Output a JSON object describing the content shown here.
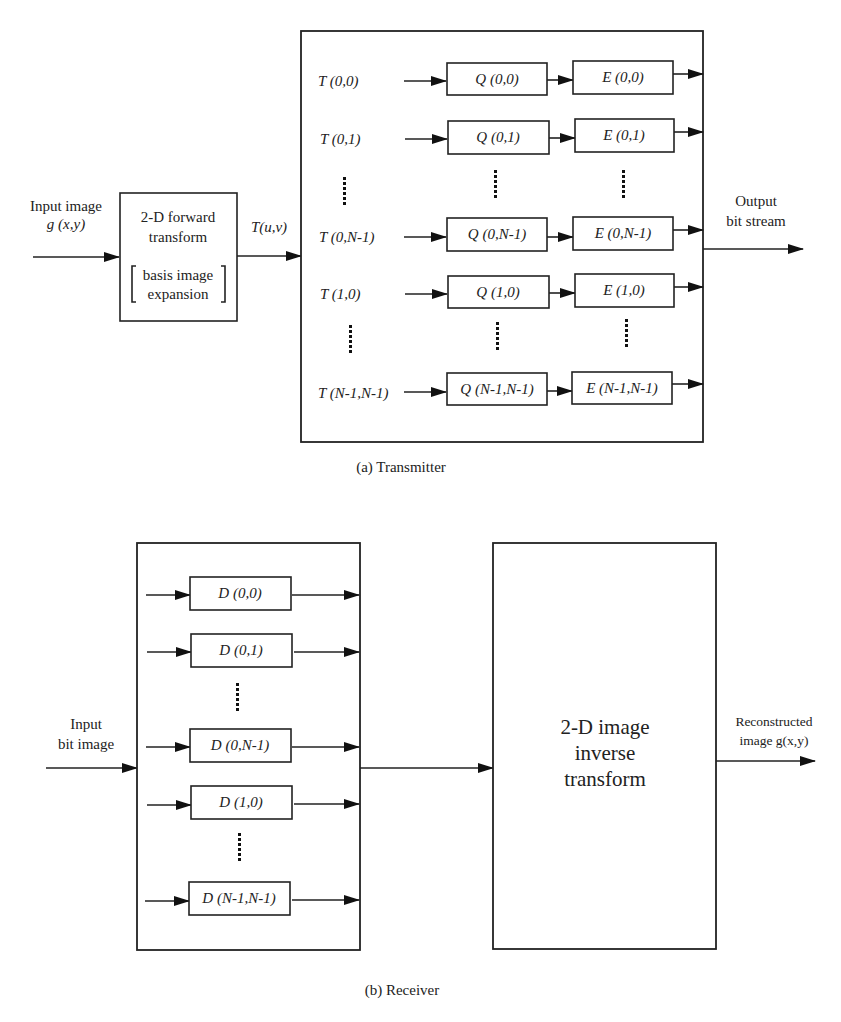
{
  "transmitter": {
    "caption": "(a) Transmitter",
    "input_label_line1": "Input image",
    "input_label_line2": "g (x,y)",
    "forward_block": {
      "line1": "2-D forward",
      "line2": "transform",
      "line3": "basis image",
      "line4": "expansion"
    },
    "transform_output_label": "T(u,v)",
    "rows": [
      {
        "t": "T (0,0)",
        "q": "Q (0,0)",
        "e": "E (0,0)"
      },
      {
        "t": "T (0,1)",
        "q": "Q (0,1)",
        "e": "E (0,1)"
      },
      {
        "t": "T (0,N-1)",
        "q": "Q (0,N-1)",
        "e": "E (0,N-1)"
      },
      {
        "t": "T (1,0)",
        "q": "Q (1,0)",
        "e": "E (1,0)"
      },
      {
        "t": "T (N-1,N-1)",
        "q": "Q (N-1,N-1)",
        "e": "E (N-1,N-1)"
      }
    ],
    "output_label_line1": "Output",
    "output_label_line2": "bit stream"
  },
  "receiver": {
    "caption": "(b) Receiver",
    "input_label_line1": "Input",
    "input_label_line2": "bit image",
    "rows": [
      {
        "d": "D (0,0)"
      },
      {
        "d": "D (0,1)"
      },
      {
        "d": "D (0,N-1)"
      },
      {
        "d": "D (1,0)"
      },
      {
        "d": "D (N-1,N-1)"
      }
    ],
    "inverse_block": {
      "line1": "2-D image",
      "line2": "inverse",
      "line3": "transform"
    },
    "output_label_line1": "Reconstructed",
    "output_label_line2": "image g(x,y)"
  }
}
